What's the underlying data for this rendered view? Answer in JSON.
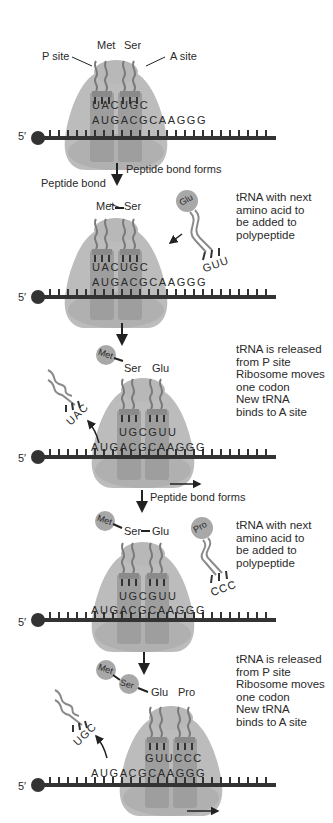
{
  "colors": {
    "ribosome": "#b8b8b8",
    "site_box": "#9e9e9e",
    "trna": "#8a8a8a",
    "mrna": "#333333",
    "aa_circle": "#a8a8a8",
    "text": "#2a2a2a"
  },
  "mrna_label": "5′",
  "mrna_sequence": "AUGACGCAAGGG",
  "panels": [
    {
      "labels": {
        "p_site": "P site",
        "a_site": "A site"
      },
      "amino_acids": [
        "Met",
        "Ser"
      ],
      "anticodons": "UACUGC",
      "mrna": "AUGACGCAAGGG"
    },
    {
      "step_label": "Peptide bond forms",
      "bond_label": "Peptide bond",
      "amino_acids": [
        "Met",
        "Ser"
      ],
      "anticodons": "UACUGC",
      "mrna": "AUGACGCAAGGG",
      "incoming_trna": {
        "amino_acid": "Glu",
        "anticodon": "GUU"
      },
      "note": "tRNA with next\namino acid to\nbe added to\npolypeptide"
    },
    {
      "amino_acids": [
        "Met",
        "Ser",
        "Glu"
      ],
      "anticodons": "UGCGUU",
      "mrna": "AUGACGCAAGGG",
      "released_trna": {
        "anticodon": "UAC"
      },
      "note": "tRNA is released\nfrom P site\nRibosome moves\none codon\nNew tRNA\nbinds to A site"
    },
    {
      "step_label": "Peptide bond forms",
      "amino_acids": [
        "Met",
        "Ser",
        "Glu"
      ],
      "anticodons": "UGCGUU",
      "mrna": "AUGACGCAAGGG",
      "incoming_trna": {
        "amino_acid": "Pro",
        "anticodon": "CCC"
      },
      "note": "tRNA with next\namino acid to\nbe added to\npolypeptide"
    },
    {
      "amino_acids": [
        "Met",
        "Ser",
        "Glu",
        "Pro"
      ],
      "anticodons": "GUUCCC",
      "mrna": "AUGACGCAAGGG",
      "released_trna": {
        "anticodon": "UGC"
      },
      "note": "tRNA is released\nfrom P site\nRibosome moves\none codon\nNew tRNA\nbinds to A site"
    }
  ]
}
